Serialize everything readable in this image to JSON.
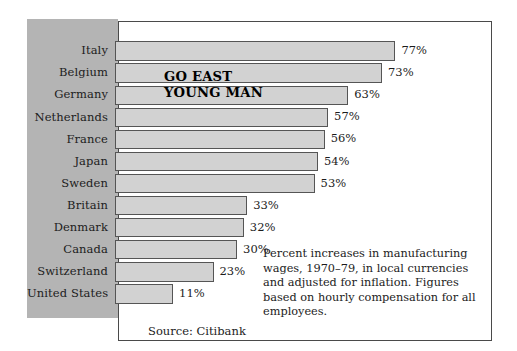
{
  "chart_data": {
    "type": "bar",
    "orientation": "horizontal",
    "title": "GO EAST YOUNG MAN",
    "title_lines": [
      "GO EAST",
      "YOUNG MAN"
    ],
    "xlabel": "",
    "ylabel": "",
    "xlim": [
      0,
      85
    ],
    "grid": false,
    "legend": null,
    "value_suffix": "%",
    "categories": [
      "Italy",
      "Belgium",
      "Germany",
      "Netherlands",
      "France",
      "Japan",
      "Sweden",
      "Britain",
      "Denmark",
      "Canada",
      "Switzerland",
      "United States"
    ],
    "values": [
      77,
      73,
      63,
      57,
      56,
      54,
      53,
      33,
      32,
      30,
      23,
      11
    ],
    "value_labels": [
      "77%",
      "73%",
      "63%",
      "57%",
      "56%",
      "54%",
      "53%",
      "33%",
      "32%",
      "30%",
      "23%",
      "11%"
    ],
    "annotation": "Percent increases in manufacturing wages, 1970–79, in local currencies and adjusted for inflation. Figures based on hourly compensation for all employees.",
    "source": "Source: Citibank"
  },
  "figure": {
    "source_label": "Source: Citibank",
    "caption": "Percent increases in manufacturing wages, 1970–79, in local currencies and adjusted for inflation. Figures based on hourly compensation for all employees.",
    "headline_line1": "GO EAST",
    "headline_line2": "YOUNG MAN"
  },
  "colors": {
    "panel_gray": "#b4b4b4",
    "bar_fill": "#d2d2d2",
    "bar_border": "#555555",
    "frame_border": "#4a4a4a",
    "text": "#1c1c1c",
    "background": "#ffffff"
  }
}
